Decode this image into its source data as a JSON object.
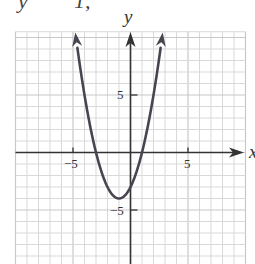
{
  "header_fragment": {
    "left": "y",
    "right": "1,"
  },
  "chart_data": {
    "type": "line",
    "title": "",
    "function": "y = x^2 + 2x - 3",
    "xlabel": "x",
    "ylabel": "y",
    "xlim": [
      -10,
      10
    ],
    "ylim": [
      -9.7,
      10.5
    ],
    "grid": true,
    "grid_step": 1,
    "x_ticks": [
      {
        "value": -5,
        "label": "-5"
      },
      {
        "value": 5,
        "label": "5"
      }
    ],
    "y_ticks": [
      {
        "value": 5,
        "label": "5"
      },
      {
        "value": -5,
        "label": "-5"
      }
    ],
    "vertex": [
      -1,
      -4
    ],
    "x_intercepts": [
      -3,
      1
    ],
    "y_intercept": -3,
    "series": [
      {
        "name": "parabola",
        "x": [
          -4.8,
          -4,
          -3,
          -2,
          -1,
          0,
          1,
          2,
          2.8
        ],
        "y": [
          10.44,
          5,
          0,
          -3,
          -4,
          -3,
          0,
          5,
          10.44
        ]
      }
    ],
    "arrows": "both ends of curve; positive ends of axes"
  },
  "colors": {
    "grid": "#d9d9d9",
    "grid_major": "#c8c8c8",
    "axis": "#333333",
    "curve": "#4a4450"
  },
  "labels": {
    "x_axis": "x",
    "y_axis": "y",
    "x_neg5": "−5",
    "x_pos5": "5",
    "y_pos5": "5",
    "y_neg5": "−5"
  }
}
